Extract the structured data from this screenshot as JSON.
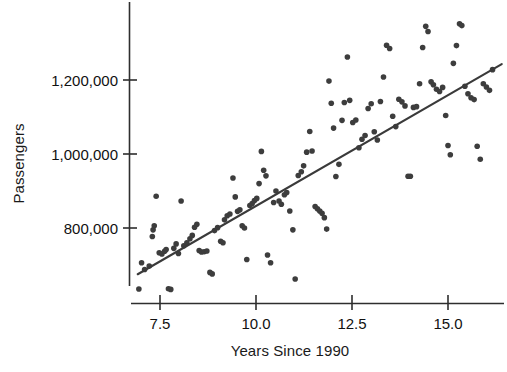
{
  "chart_data": {
    "type": "scatter",
    "title": "",
    "xlabel": "Years Since 1990",
    "ylabel": "Passengers",
    "xlim": [
      6.9,
      16.4
    ],
    "ylim": [
      620000,
      1380000
    ],
    "grid": false,
    "legend": null,
    "marker_color": "#3d3d3d",
    "marker_size_px": 5.6,
    "line_color": "#3a3a3a",
    "xticks": [
      7.5,
      10.0,
      12.5,
      15.0
    ],
    "xtick_labels": [
      "7.5",
      "10.0",
      "12.5",
      "15.0"
    ],
    "yticks": [
      800000,
      1000000,
      1200000
    ],
    "ytick_labels": [
      "800,000",
      "1,000,000",
      "1,200,000"
    ],
    "trendline": {
      "name": "least-squares regression line",
      "x_start": 6.92,
      "y_start": 675000,
      "x_end": 16.4,
      "y_end": 1243000,
      "slope_per_year": 59900,
      "intercept": 261400
    },
    "series": [
      {
        "name": "Passengers by year",
        "points": [
          [
            6.95,
            635000
          ],
          [
            7.02,
            706000
          ],
          [
            7.1,
            688000
          ],
          [
            7.22,
            697000
          ],
          [
            7.3,
            777000
          ],
          [
            7.32,
            795000
          ],
          [
            7.35,
            806000
          ],
          [
            7.4,
            886000
          ],
          [
            7.48,
            733000
          ],
          [
            7.55,
            730000
          ],
          [
            7.62,
            737000
          ],
          [
            7.66,
            742000
          ],
          [
            7.72,
            636000
          ],
          [
            7.78,
            634000
          ],
          [
            7.86,
            745000
          ],
          [
            7.92,
            757000
          ],
          [
            7.98,
            731000
          ],
          [
            8.05,
            873000
          ],
          [
            8.12,
            752000
          ],
          [
            8.2,
            760000
          ],
          [
            8.28,
            771000
          ],
          [
            8.34,
            780000
          ],
          [
            8.4,
            802000
          ],
          [
            8.46,
            810000
          ],
          [
            8.52,
            739000
          ],
          [
            8.58,
            735000
          ],
          [
            8.65,
            736000
          ],
          [
            8.72,
            738000
          ],
          [
            8.8,
            680000
          ],
          [
            8.86,
            676000
          ],
          [
            8.92,
            793000
          ],
          [
            9.0,
            801000
          ],
          [
            9.08,
            764000
          ],
          [
            9.14,
            760000
          ],
          [
            9.18,
            822000
          ],
          [
            9.25,
            833000
          ],
          [
            9.32,
            838000
          ],
          [
            9.4,
            935000
          ],
          [
            9.46,
            884000
          ],
          [
            9.52,
            845000
          ],
          [
            9.58,
            849000
          ],
          [
            9.64,
            806000
          ],
          [
            9.7,
            800000
          ],
          [
            9.76,
            715000
          ],
          [
            9.84,
            861000
          ],
          [
            9.9,
            866000
          ],
          [
            9.96,
            874000
          ],
          [
            10.02,
            880000
          ],
          [
            10.08,
            920000
          ],
          [
            10.14,
            1007000
          ],
          [
            10.2,
            956000
          ],
          [
            10.26,
            941000
          ],
          [
            10.3,
            727000
          ],
          [
            10.38,
            706000
          ],
          [
            10.46,
            869000
          ],
          [
            10.52,
            900000
          ],
          [
            10.6,
            873000
          ],
          [
            10.66,
            864000
          ],
          [
            10.74,
            890000
          ],
          [
            10.8,
            896000
          ],
          [
            10.88,
            846000
          ],
          [
            10.96,
            795000
          ],
          [
            11.02,
            662000
          ],
          [
            11.1,
            942000
          ],
          [
            11.18,
            952000
          ],
          [
            11.24,
            968000
          ],
          [
            11.32,
            1005000
          ],
          [
            11.4,
            1061000
          ],
          [
            11.46,
            1008000
          ],
          [
            11.54,
            858000
          ],
          [
            11.6,
            852000
          ],
          [
            11.66,
            846000
          ],
          [
            11.72,
            840000
          ],
          [
            11.78,
            828000
          ],
          [
            11.84,
            797000
          ],
          [
            11.9,
            1197000
          ],
          [
            11.96,
            1137000
          ],
          [
            12.02,
            1070000
          ],
          [
            12.08,
            939000
          ],
          [
            12.16,
            972000
          ],
          [
            12.24,
            1091000
          ],
          [
            12.3,
            1139000
          ],
          [
            12.38,
            1262000
          ],
          [
            12.44,
            1145000
          ],
          [
            12.52,
            1085000
          ],
          [
            12.6,
            1092000
          ],
          [
            12.68,
            1017000
          ],
          [
            12.76,
            1040000
          ],
          [
            12.84,
            1050000
          ],
          [
            12.92,
            1123000
          ],
          [
            13.0,
            1136000
          ],
          [
            13.08,
            1060000
          ],
          [
            13.16,
            1038000
          ],
          [
            13.24,
            1142000
          ],
          [
            13.32,
            1208000
          ],
          [
            13.4,
            1294000
          ],
          [
            13.48,
            1285000
          ],
          [
            13.56,
            1102000
          ],
          [
            13.64,
            1074000
          ],
          [
            13.72,
            1148000
          ],
          [
            13.8,
            1141000
          ],
          [
            13.88,
            1130000
          ],
          [
            13.96,
            940000
          ],
          [
            14.02,
            940000
          ],
          [
            14.1,
            1126000
          ],
          [
            14.18,
            1128000
          ],
          [
            14.26,
            1190000
          ],
          [
            14.34,
            1288000
          ],
          [
            14.42,
            1345000
          ],
          [
            14.48,
            1331000
          ],
          [
            14.56,
            1195000
          ],
          [
            14.62,
            1187000
          ],
          [
            14.7,
            1175000
          ],
          [
            14.78,
            1169000
          ],
          [
            14.86,
            1180000
          ],
          [
            14.94,
            1104000
          ],
          [
            15.0,
            1023000
          ],
          [
            15.06,
            998000
          ],
          [
            15.14,
            1245000
          ],
          [
            15.22,
            1293000
          ],
          [
            15.3,
            1352000
          ],
          [
            15.36,
            1347000
          ],
          [
            15.44,
            1183000
          ],
          [
            15.52,
            1163000
          ],
          [
            15.6,
            1152000
          ],
          [
            15.68,
            1147000
          ],
          [
            15.76,
            1021000
          ],
          [
            15.84,
            986000
          ],
          [
            15.92,
            1190000
          ],
          [
            16.0,
            1181000
          ],
          [
            16.08,
            1172000
          ],
          [
            16.16,
            1228000
          ]
        ]
      }
    ]
  },
  "axes": {
    "y_title": "Passengers",
    "x_title": "Years Since 1990"
  }
}
